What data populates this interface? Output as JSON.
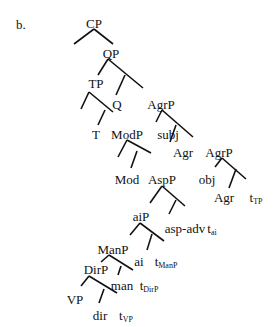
{
  "example_label": "b.",
  "tree": {
    "nodes": [
      {
        "id": "CP",
        "label": "CP",
        "sub": "",
        "x": 94,
        "y": 17
      },
      {
        "id": "QP",
        "label": "QP",
        "sub": "",
        "x": 111,
        "y": 47
      },
      {
        "id": "TP",
        "label": "TP",
        "sub": "",
        "x": 96,
        "y": 77
      },
      {
        "id": "Q",
        "label": "Q",
        "sub": "",
        "x": 117,
        "y": 98
      },
      {
        "id": "AgrP1",
        "label": "AgrP",
        "sub": "",
        "x": 161,
        "y": 98
      },
      {
        "id": "T",
        "label": "T",
        "sub": "",
        "x": 96,
        "y": 128
      },
      {
        "id": "ModP",
        "label": "ModP",
        "sub": "",
        "x": 127,
        "y": 128
      },
      {
        "id": "subj",
        "label": "subj",
        "sub": "",
        "x": 168,
        "y": 128
      },
      {
        "id": "Agr1",
        "label": "Agr",
        "sub": "",
        "x": 183,
        "y": 146
      },
      {
        "id": "AgrP2",
        "label": "AgrP",
        "sub": "",
        "x": 219,
        "y": 146
      },
      {
        "id": "Mod",
        "label": "Mod",
        "sub": "",
        "x": 127,
        "y": 173
      },
      {
        "id": "AspP",
        "label": "AspP",
        "sub": "",
        "x": 162,
        "y": 173
      },
      {
        "id": "obj",
        "label": "obj",
        "sub": "",
        "x": 207,
        "y": 173
      },
      {
        "id": "Agr2",
        "label": "Agr",
        "sub": "",
        "x": 224,
        "y": 191
      },
      {
        "id": "tTP",
        "label": "t",
        "sub": "TP",
        "x": 256,
        "y": 191
      },
      {
        "id": "aiP",
        "label": "aiP",
        "sub": "",
        "x": 141,
        "y": 210
      },
      {
        "id": "aspadv",
        "label": "asp-adv",
        "sub": "",
        "x": 185,
        "y": 222
      },
      {
        "id": "tai",
        "label": "t",
        "sub": "ai",
        "x": 212,
        "y": 222
      },
      {
        "id": "ManP",
        "label": "ManP",
        "sub": "",
        "x": 113,
        "y": 243
      },
      {
        "id": "ai",
        "label": "ai",
        "sub": "",
        "x": 139,
        "y": 255
      },
      {
        "id": "tManP",
        "label": "t",
        "sub": "ManP",
        "x": 166,
        "y": 255
      },
      {
        "id": "DirP",
        "label": "DirP",
        "sub": "",
        "x": 96,
        "y": 263
      },
      {
        "id": "man",
        "label": "man",
        "sub": "",
        "x": 122,
        "y": 279
      },
      {
        "id": "tDirP",
        "label": "t",
        "sub": "DirP",
        "x": 149,
        "y": 279
      },
      {
        "id": "VP",
        "label": "VP",
        "sub": "",
        "x": 75,
        "y": 293
      },
      {
        "id": "dir",
        "label": "dir",
        "sub": "",
        "x": 100,
        "y": 309
      },
      {
        "id": "tVP",
        "label": "t",
        "sub": "VP",
        "x": 126,
        "y": 309
      }
    ],
    "edges": [
      [
        94,
        29,
        74,
        44
      ],
      [
        94,
        29,
        113,
        44
      ],
      [
        108,
        59,
        98,
        75
      ],
      [
        108,
        59,
        143,
        88
      ],
      [
        125,
        75,
        116,
        95
      ],
      [
        89,
        92,
        81,
        109
      ],
      [
        89,
        92,
        113,
        112
      ],
      [
        105,
        110,
        98,
        125
      ],
      [
        162,
        110,
        156,
        122
      ],
      [
        162,
        110,
        193,
        137
      ],
      [
        176,
        125,
        170,
        142
      ],
      [
        127,
        140,
        118,
        157
      ],
      [
        127,
        140,
        151,
        153
      ],
      [
        137,
        151,
        131,
        168
      ],
      [
        222,
        158,
        215,
        167
      ],
      [
        222,
        158,
        246,
        179
      ],
      [
        236,
        169,
        229,
        188
      ],
      [
        162,
        186,
        150,
        203
      ],
      [
        162,
        186,
        185,
        206
      ],
      [
        176,
        200,
        169,
        214
      ],
      [
        140,
        223,
        130,
        235
      ],
      [
        140,
        223,
        164,
        241
      ],
      [
        152,
        234,
        147,
        250
      ],
      [
        109,
        255,
        101,
        262
      ],
      [
        109,
        255,
        133,
        270
      ],
      [
        121,
        266,
        118,
        275
      ],
      [
        89,
        276,
        81,
        286
      ],
      [
        89,
        276,
        117,
        293
      ],
      [
        104,
        289,
        99,
        303
      ]
    ],
    "stroke_color": "#111111"
  }
}
